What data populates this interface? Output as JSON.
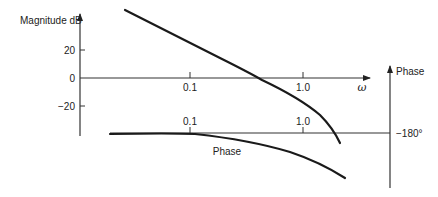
{
  "diagram": {
    "type": "bode-plot",
    "magnitude_axis": {
      "label": "Magnitude dB",
      "ticks": [
        {
          "label": "20",
          "y": 50
        },
        {
          "label": "0",
          "y": 78
        },
        {
          "label": "−20",
          "y": 106
        }
      ]
    },
    "frequency_axis": {
      "label": "ω",
      "ticks_upper": [
        {
          "label": "0.1",
          "x": 190
        },
        {
          "label": "1.0",
          "x": 303
        }
      ],
      "ticks_lower": [
        {
          "label": "0.1",
          "x": 190
        },
        {
          "label": "1.0",
          "x": 303
        }
      ]
    },
    "phase_axis": {
      "label": "Phase",
      "ref_label": "−180°"
    },
    "curves": {
      "magnitude_label": "",
      "phase_label": "Phase"
    },
    "colors": {
      "line": "#1a1a1a",
      "axis": "#333333"
    }
  }
}
